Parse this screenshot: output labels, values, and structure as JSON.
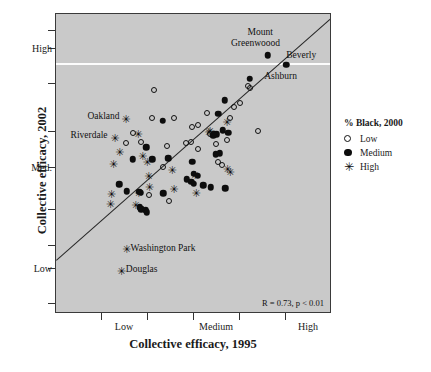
{
  "chart_data": {
    "type": "scatter",
    "title": "",
    "xlabel": "Collective efficacy, 1995",
    "ylabel": "Collective efficacy, 2002",
    "xtick_labels": [
      "Low",
      "Medium",
      "High"
    ],
    "ytick_labels": [
      "High",
      "Med.",
      "Low"
    ],
    "xlim": [
      0,
      1
    ],
    "ylim": [
      0,
      1
    ],
    "grid": false,
    "annotation": "R = 0.73, p < 0.01",
    "legend": {
      "title": "% Black, 2000",
      "position": "right",
      "entries": [
        {
          "label": "Low",
          "marker": "open-circle"
        },
        {
          "label": "Medium",
          "marker": "filled-circle"
        },
        {
          "label": "High",
          "marker": "star"
        }
      ]
    },
    "reference_line": {
      "name": "regression-line",
      "x1": 0.0,
      "y1": 0.175,
      "x2": 1.0,
      "y2": 0.985
    },
    "series": [
      {
        "name": "Low",
        "marker": "open-circle",
        "points": [
          [
            0.357,
            0.745
          ],
          [
            0.432,
            0.652
          ],
          [
            0.552,
            0.668
          ],
          [
            0.52,
            0.628
          ],
          [
            0.497,
            0.62
          ],
          [
            0.492,
            0.572
          ],
          [
            0.474,
            0.568
          ],
          [
            0.517,
            0.547
          ],
          [
            0.585,
            0.563
          ],
          [
            0.672,
            0.7
          ],
          [
            0.636,
            0.65
          ],
          [
            0.7,
            0.76
          ],
          [
            0.707,
            0.753
          ],
          [
            0.739,
            0.608
          ],
          [
            0.591,
            0.502
          ],
          [
            0.607,
            0.492
          ],
          [
            0.312,
            0.572
          ],
          [
            0.404,
            0.558
          ],
          [
            0.392,
            0.487
          ],
          [
            0.338,
            0.393
          ],
          [
            0.411,
            0.372
          ],
          [
            0.281,
            0.602
          ],
          [
            0.256,
            0.566
          ],
          [
            0.349,
            0.652
          ],
          [
            0.623,
            0.577
          ],
          [
            0.563,
            0.596
          ],
          [
            0.65,
            0.688
          ]
        ]
      },
      {
        "name": "Medium",
        "marker": "filled-circle",
        "points": [
          [
            0.773,
            0.862
          ],
          [
            0.84,
            0.83
          ],
          [
            0.707,
            0.782
          ],
          [
            0.616,
            0.71
          ],
          [
            0.592,
            0.665
          ],
          [
            0.608,
            0.61
          ],
          [
            0.577,
            0.598
          ],
          [
            0.586,
            0.596
          ],
          [
            0.573,
            0.593
          ],
          [
            0.628,
            0.602
          ],
          [
            0.598,
            0.533
          ],
          [
            0.583,
            0.53
          ],
          [
            0.389,
            0.642
          ],
          [
            0.33,
            0.553
          ],
          [
            0.409,
            0.516
          ],
          [
            0.352,
            0.512
          ],
          [
            0.281,
            0.512
          ],
          [
            0.497,
            0.504
          ],
          [
            0.503,
            0.464
          ],
          [
            0.518,
            0.458
          ],
          [
            0.478,
            0.445
          ],
          [
            0.494,
            0.437
          ],
          [
            0.502,
            0.43
          ],
          [
            0.538,
            0.425
          ],
          [
            0.565,
            0.418
          ],
          [
            0.617,
            0.415
          ],
          [
            0.23,
            0.428
          ],
          [
            0.258,
            0.405
          ],
          [
            0.303,
            0.403
          ],
          [
            0.31,
            0.4
          ],
          [
            0.391,
            0.398
          ],
          [
            0.306,
            0.352
          ],
          [
            0.312,
            0.344
          ],
          [
            0.327,
            0.341
          ],
          [
            0.332,
            0.335
          ]
        ]
      },
      {
        "name": "High",
        "marker": "star",
        "points": [
          [
            0.255,
            0.648
          ],
          [
            0.214,
            0.585
          ],
          [
            0.232,
            0.537
          ],
          [
            0.209,
            0.495
          ],
          [
            0.299,
            0.598
          ],
          [
            0.316,
            0.525
          ],
          [
            0.332,
            0.503
          ],
          [
            0.338,
            0.455
          ],
          [
            0.34,
            0.42
          ],
          [
            0.301,
            0.398
          ],
          [
            0.202,
            0.397
          ],
          [
            0.198,
            0.362
          ],
          [
            0.29,
            0.358
          ],
          [
            0.423,
            0.478
          ],
          [
            0.43,
            0.412
          ],
          [
            0.557,
            0.604
          ],
          [
            0.561,
            0.608
          ],
          [
            0.623,
            0.637
          ],
          [
            0.625,
            0.48
          ],
          [
            0.635,
            0.47
          ],
          [
            0.511,
            0.4
          ],
          [
            0.506,
            0.459
          ],
          [
            0.257,
            0.21
          ],
          [
            0.238,
            0.138
          ]
        ]
      }
    ],
    "point_labels": [
      {
        "text": "Mount",
        "x": 0.745,
        "y": 0.935,
        "align": "center"
      },
      {
        "text": "Greenwoood",
        "x": 0.728,
        "y": 0.898,
        "align": "center"
      },
      {
        "text": "Beverly",
        "x": 0.895,
        "y": 0.858,
        "align": "center"
      },
      {
        "text": "Ashburn",
        "x": 0.76,
        "y": 0.787,
        "align": "left"
      },
      {
        "text": "Oakland",
        "x": 0.232,
        "y": 0.655,
        "align": "right"
      },
      {
        "text": "Riverdale",
        "x": 0.188,
        "y": 0.592,
        "align": "right"
      },
      {
        "text": "Washington Park",
        "x": 0.272,
        "y": 0.212,
        "align": "left"
      },
      {
        "text": "Douglas",
        "x": 0.255,
        "y": 0.14,
        "align": "left"
      }
    ]
  },
  "colors": {
    "plot_background": "#c9c9c9",
    "page_background": "#ffffff",
    "marker": "#0d0d0d",
    "frame": "#3a3a3a",
    "fit_line": "#262626",
    "scan_line": "#ffffff"
  }
}
